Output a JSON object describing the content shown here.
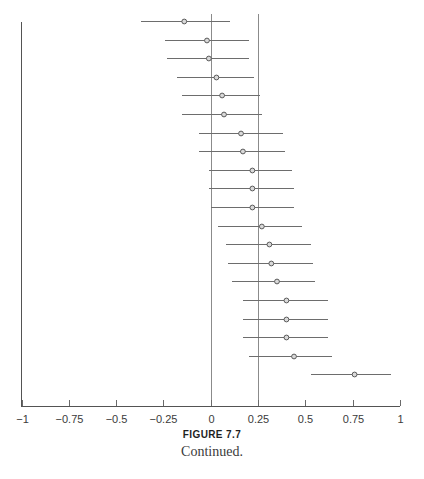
{
  "caption": {
    "title": "FIGURE 7.7",
    "subtitle": "Continued."
  },
  "chart_data": {
    "type": "scatter",
    "subtype": "forest-plot",
    "title": "",
    "xlabel": "",
    "ylabel": "",
    "xlim": [
      -1,
      1
    ],
    "ylim": [
      0,
      21
    ],
    "grid": false,
    "legend": null,
    "x_ticks": [
      -1,
      -0.75,
      -0.5,
      -0.25,
      0,
      0.25,
      0.5,
      0.75,
      1
    ],
    "x_tick_labels": [
      "−1",
      "−0.75",
      "−0.5",
      "−0.25",
      "0",
      "0.25",
      "0.5",
      "0.75",
      "1"
    ],
    "reference_lines": [
      0,
      0.25
    ],
    "y_axis_visible": true,
    "y_tick_labels": [],
    "marker": "open-circle",
    "series": [
      {
        "name": "Effect size with 95% CI",
        "points": [
          {
            "index": 1,
            "estimate": -0.14,
            "ci_low": -0.37,
            "ci_high": 0.1
          },
          {
            "index": 2,
            "estimate": -0.02,
            "ci_low": -0.24,
            "ci_high": 0.2
          },
          {
            "index": 3,
            "estimate": -0.01,
            "ci_low": -0.23,
            "ci_high": 0.2
          },
          {
            "index": 4,
            "estimate": 0.03,
            "ci_low": -0.18,
            "ci_high": 0.23
          },
          {
            "index": 5,
            "estimate": 0.06,
            "ci_low": -0.15,
            "ci_high": 0.26
          },
          {
            "index": 6,
            "estimate": 0.07,
            "ci_low": -0.15,
            "ci_high": 0.27
          },
          {
            "index": 7,
            "estimate": 0.16,
            "ci_low": -0.06,
            "ci_high": 0.38
          },
          {
            "index": 8,
            "estimate": 0.17,
            "ci_low": -0.06,
            "ci_high": 0.39
          },
          {
            "index": 9,
            "estimate": 0.22,
            "ci_low": -0.01,
            "ci_high": 0.43
          },
          {
            "index": 10,
            "estimate": 0.22,
            "ci_low": -0.01,
            "ci_high": 0.44
          },
          {
            "index": 11,
            "estimate": 0.22,
            "ci_low": 0.0,
            "ci_high": 0.44
          },
          {
            "index": 12,
            "estimate": 0.27,
            "ci_low": 0.04,
            "ci_high": 0.48
          },
          {
            "index": 13,
            "estimate": 0.31,
            "ci_low": 0.08,
            "ci_high": 0.53
          },
          {
            "index": 14,
            "estimate": 0.32,
            "ci_low": 0.09,
            "ci_high": 0.54
          },
          {
            "index": 15,
            "estimate": 0.35,
            "ci_low": 0.11,
            "ci_high": 0.55
          },
          {
            "index": 16,
            "estimate": 0.4,
            "ci_low": 0.17,
            "ci_high": 0.62
          },
          {
            "index": 17,
            "estimate": 0.4,
            "ci_low": 0.17,
            "ci_high": 0.62
          },
          {
            "index": 18,
            "estimate": 0.4,
            "ci_low": 0.17,
            "ci_high": 0.62
          },
          {
            "index": 19,
            "estimate": 0.44,
            "ci_low": 0.2,
            "ci_high": 0.64
          },
          {
            "index": 20,
            "estimate": 0.76,
            "ci_low": 0.53,
            "ci_high": 0.95
          }
        ]
      }
    ]
  },
  "colors": {
    "axis": "#545454",
    "reference_line": "#8b8b8b",
    "ci_line": "#6d6d6d",
    "marker_stroke": "#5a5a5a",
    "marker_fill": "#d9d9d9",
    "text": "#3b3b3b",
    "background": "#ffffff"
  }
}
